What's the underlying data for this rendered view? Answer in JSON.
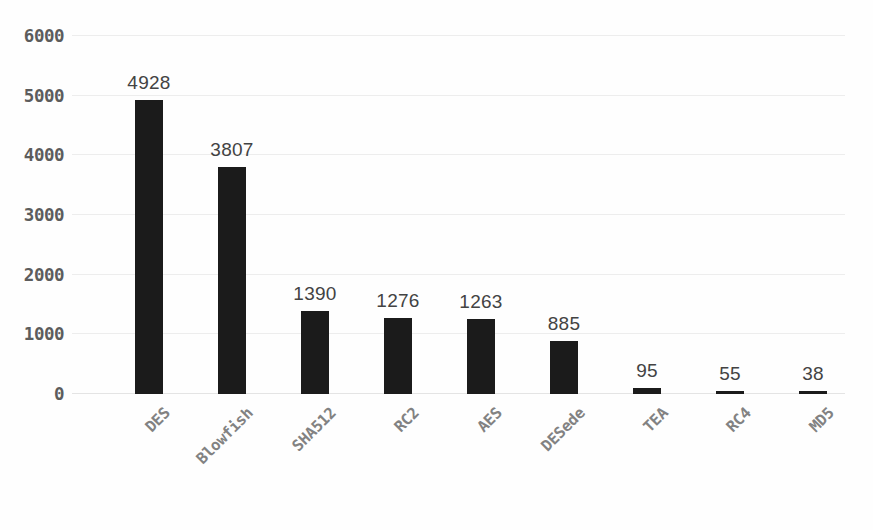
{
  "chart_data": {
    "type": "bar",
    "title": "",
    "subtitle": "",
    "xlabel": "",
    "ylabel": "",
    "categories": [
      "DES",
      "Blowfish",
      "SHA512",
      "RC2",
      "AES",
      "DESede",
      "TEA",
      "RC4",
      "MD5"
    ],
    "values": [
      4928,
      3807,
      1390,
      1276,
      1263,
      885,
      95,
      55,
      38
    ],
    "data_labels": [
      "4928",
      "3807",
      "1390",
      "1276",
      "1263",
      "885",
      "95",
      "55",
      "38"
    ],
    "ylim": [
      0,
      6000
    ],
    "y_ticks": [
      0,
      1000,
      2000,
      3000,
      4000,
      5000,
      6000
    ],
    "y_tick_labels": [
      "0",
      "1000",
      "2000",
      "3000",
      "4000",
      "5000",
      "6000"
    ],
    "grid": true,
    "grid_axis": "y",
    "legend": false,
    "legend_position": "none",
    "bar_color": "#1b1b1b",
    "gridline_color": "#ededed",
    "ytick_color": "#5c5c5c",
    "xtick_color": "#828282",
    "data_label_color": "#434343",
    "background_color": "#fefefe",
    "xtick_rotation": -45
  }
}
